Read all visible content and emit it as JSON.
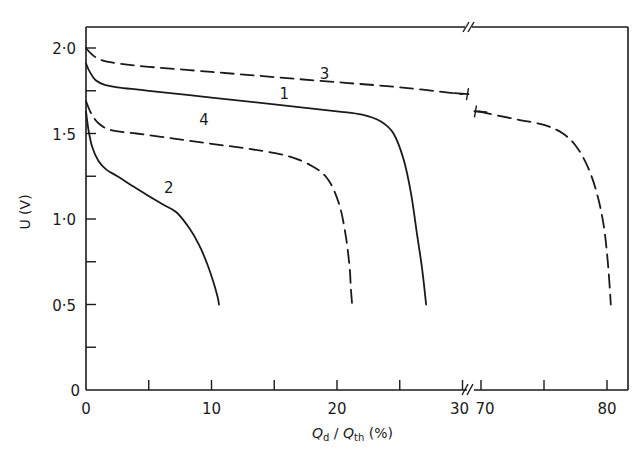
{
  "chart_data": {
    "type": "line",
    "title": "",
    "xlabel": "Q_d / Q_th (%)",
    "ylabel": "U (V)",
    "xlabel_parts": {
      "q1": "Q",
      "sub1": "d",
      "slash": " / ",
      "q2": "Q",
      "sub2": "th",
      "unit": " (%)"
    },
    "ylabel_text": "U (V)",
    "x_axis_break": {
      "from": 30.5,
      "to": 69.5
    },
    "xlim_left": [
      0,
      30.5
    ],
    "xlim_right": [
      69.5,
      81.7
    ],
    "ylim": [
      0,
      2.1
    ],
    "x_ticks_left": [
      0,
      5,
      10,
      15,
      20,
      25,
      30
    ],
    "x_ticks_right": [
      70,
      75,
      80
    ],
    "x_tick_labels": [
      {
        "value": 0,
        "label": "0"
      },
      {
        "value": 10,
        "label": "10"
      },
      {
        "value": 20,
        "label": "20"
      },
      {
        "value": 30,
        "label": "30"
      },
      {
        "value": 70,
        "label": "70"
      },
      {
        "value": 80,
        "label": "80"
      }
    ],
    "y_ticks": [
      0,
      0.25,
      0.5,
      0.75,
      1.0,
      1.25,
      1.5,
      1.75,
      2.0
    ],
    "y_tick_labels": [
      {
        "value": 0,
        "label": "0"
      },
      {
        "value": 0.5,
        "label": "0·5"
      },
      {
        "value": 1.0,
        "label": "1·0"
      },
      {
        "value": 1.5,
        "label": "1·5"
      },
      {
        "value": 2.0,
        "label": "2·0"
      }
    ],
    "grid": false,
    "legend": "inline curve numbers",
    "series": [
      {
        "name": "1",
        "style": "solid",
        "label_pos": [
          15.8,
          1.7
        ],
        "x": [
          0,
          0.3,
          0.8,
          1.5,
          2.5,
          5,
          10,
          15,
          20,
          22,
          23.5,
          24.5,
          25.3,
          25.9,
          26.4,
          26.8,
          27.1
        ],
        "y": [
          1.91,
          1.86,
          1.81,
          1.785,
          1.77,
          1.75,
          1.71,
          1.67,
          1.63,
          1.61,
          1.57,
          1.5,
          1.35,
          1.15,
          0.9,
          0.7,
          0.5
        ]
      },
      {
        "name": "2",
        "style": "solid",
        "label_pos": [
          6.6,
          1.15
        ],
        "x": [
          0,
          0.2,
          0.5,
          1.0,
          1.6,
          2.5,
          4,
          6,
          7.2,
          8.2,
          9.0,
          9.7,
          10.2,
          10.5,
          10.6
        ],
        "y": [
          1.63,
          1.52,
          1.42,
          1.34,
          1.29,
          1.25,
          1.18,
          1.09,
          1.04,
          0.95,
          0.85,
          0.73,
          0.62,
          0.54,
          0.5
        ]
      },
      {
        "name": "3",
        "style": "dashed",
        "label_pos": [
          19,
          1.82
        ],
        "x": [
          0,
          0.5,
          1.2,
          2.5,
          5,
          10,
          15,
          20,
          25,
          30
        ],
        "y": [
          2.0,
          1.96,
          1.93,
          1.91,
          1.89,
          1.86,
          1.83,
          1.8,
          1.77,
          1.73
        ]
      },
      {
        "name": "3 (continued)",
        "style": "dashed",
        "x": [
          69.8,
          71,
          73,
          75,
          76.5,
          77.6,
          78.5,
          79.2,
          79.7,
          80.0,
          80.2,
          80.3
        ],
        "y": [
          1.63,
          1.61,
          1.58,
          1.55,
          1.5,
          1.42,
          1.3,
          1.15,
          0.98,
          0.8,
          0.62,
          0.5
        ]
      },
      {
        "name": "4",
        "style": "dashed",
        "label_pos": [
          9.4,
          1.55
        ],
        "x": [
          0,
          0.4,
          1.0,
          2.0,
          4,
          7,
          10,
          13,
          16,
          18,
          19.3,
          20.2,
          20.7,
          21.0,
          21.1,
          21.2
        ],
        "y": [
          1.69,
          1.62,
          1.56,
          1.52,
          1.5,
          1.47,
          1.44,
          1.41,
          1.37,
          1.31,
          1.23,
          1.08,
          0.9,
          0.72,
          0.6,
          0.5
        ]
      }
    ]
  }
}
